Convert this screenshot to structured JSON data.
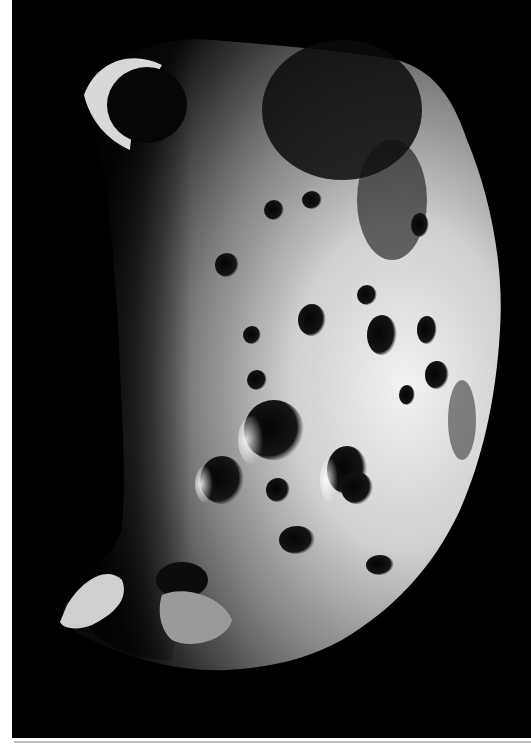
{
  "image": {
    "subject": "cratered moon surface photograph",
    "description": "Black-and-white photograph of a heavily cratered irregular moon, lit from the right, against a black sky, with a white scan border on the left and bottom.",
    "colors": {
      "background": "#000000",
      "border": "#ffffff",
      "bottom_rule": "#bdbdbd",
      "surface_light": "#e8e8e8",
      "surface_mid": "#9a9a9a",
      "surface_dark": "#3a3a3a"
    }
  }
}
